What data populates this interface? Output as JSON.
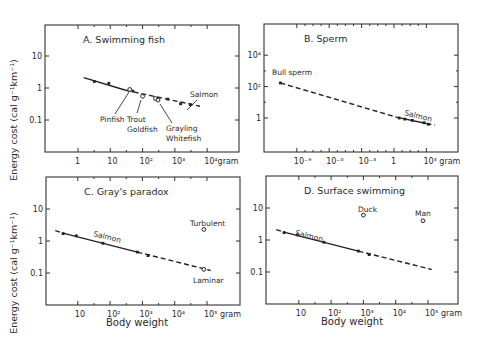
{
  "figure": {
    "y_axis_label": "Energy cost (cal g⁻¹km⁻¹)",
    "x_axis_label": "Body weight"
  },
  "chart_data": [
    {
      "id": "A",
      "type": "scatter",
      "title": "A.  Swimming fish",
      "xlabel": "",
      "ylabel": "Energy cost (cal g⁻¹km⁻¹)",
      "xscale": "log",
      "yscale": "log",
      "xlim": [
        0.1,
        100000
      ],
      "ylim": [
        0.01,
        100
      ],
      "x_ticks": [
        {
          "v": 1,
          "label": "1"
        },
        {
          "v": 10,
          "label": "10"
        },
        {
          "v": 100,
          "label": "10²"
        },
        {
          "v": 1000,
          "label": "10³"
        },
        {
          "v": 10000,
          "label": "10⁴gram"
        }
      ],
      "y_ticks": [
        {
          "v": 10,
          "label": "10"
        },
        {
          "v": 1,
          "label": "1"
        },
        {
          "v": 0.1,
          "label": "0.1"
        }
      ],
      "frame": {
        "x0": 45,
        "y0": 25,
        "x1": 239,
        "y1": 152
      },
      "map": {
        "x_px_at_1": 78,
        "px_per_decade_x": 32.3,
        "y_px_at_1": 88,
        "px_per_decade_y": 32
      },
      "lines": [
        {
          "style": "solid",
          "points": [
            [
              1.5,
              2.1
            ],
            [
              30,
              0.85
            ]
          ]
        },
        {
          "style": "dashed",
          "points": [
            [
              30,
              0.85
            ],
            [
              6000,
              0.27
            ]
          ]
        }
      ],
      "series": [
        {
          "name": "Salmon",
          "marker": "filled",
          "x": [
            3.2,
            9,
            50,
            600,
            1500,
            3000
          ],
          "y": [
            1.6,
            1.4,
            0.8,
            0.45,
            0.32,
            0.3
          ]
        },
        {
          "name": "Pinfish",
          "marker": "open",
          "x": [
            40
          ],
          "y": [
            0.9
          ]
        },
        {
          "name": "Trout/Goldfish",
          "marker": "open",
          "x": [
            100
          ],
          "y": [
            0.55
          ]
        },
        {
          "name": "Grayling/Whitefish",
          "marker": "open",
          "x": [
            250,
            300
          ],
          "y": [
            0.47,
            0.42
          ]
        }
      ],
      "annotations": [
        {
          "text": "Salmon",
          "x": 190,
          "y": 97,
          "leader": [
            197,
            100,
            187,
            110
          ]
        },
        {
          "text": "Pinfish",
          "x": 100,
          "y": 122,
          "leader": [
            115,
            114,
            129,
            92
          ]
        },
        {
          "text": "Trout",
          "x": 127,
          "y": 122,
          "leader": [
            137,
            113,
            141,
            100
          ]
        },
        {
          "text": "Goldfish",
          "x": 127,
          "y": 132,
          "leader": null
        },
        {
          "text": "Grayling",
          "x": 166,
          "y": 131,
          "leader": [
            172,
            123,
            160,
            104
          ]
        },
        {
          "text": "Whitefish",
          "x": 166,
          "y": 141,
          "leader": null
        }
      ]
    },
    {
      "id": "B",
      "type": "scatter",
      "title": "B.  Sperm",
      "xlabel": "",
      "ylabel": "",
      "xscale": "log",
      "yscale": "log",
      "xlim": [
        1e-12,
        1000000.0
      ],
      "ylim": [
        0.01,
        1000000
      ],
      "x_ticks": [
        {
          "v": 1e-09,
          "label": "10⁻⁹"
        },
        {
          "v": 1e-06,
          "label": "10⁻⁶"
        },
        {
          "v": 0.001,
          "label": "10⁻³"
        },
        {
          "v": 1,
          "label": "1"
        },
        {
          "v": 1000,
          "label": "10³ gram"
        }
      ],
      "y_ticks": [
        {
          "v": 10000,
          "label": "10⁴"
        },
        {
          "v": 100,
          "label": "10²"
        },
        {
          "v": 1,
          "label": "1"
        }
      ],
      "frame": {
        "x0": 264,
        "y0": 24,
        "x1": 458,
        "y1": 152
      },
      "map": {
        "x_px_at_1": 394,
        "px_per_decade_x": 10.8,
        "y_px_at_1": 118,
        "px_per_decade_y": 15.7
      },
      "lines": [
        {
          "style": "dashed",
          "points": [
            [
              3e-11,
              170
            ],
            [
              2,
              1.1
            ]
          ]
        },
        {
          "style": "solid",
          "points": [
            [
              2,
              1.1
            ],
            [
              1000,
              0.45
            ]
          ]
        },
        {
          "style": "dashed",
          "points": [
            [
              1000,
              0.45
            ],
            [
              6000,
              0.35
            ]
          ]
        }
      ],
      "series": [
        {
          "name": "Bull sperm",
          "marker": "filled",
          "x": [
            3e-11
          ],
          "y": [
            170
          ]
        },
        {
          "name": "Salmon",
          "marker": "filled",
          "x": [
            3,
            10,
            50,
            600,
            1500
          ],
          "y": [
            1.0,
            0.85,
            0.7,
            0.5,
            0.4
          ]
        }
      ],
      "annotations": [
        {
          "text": "Bull sperm",
          "x": 272,
          "y": 75,
          "leader": null
        },
        {
          "text": "Salmon",
          "x": 404,
          "y": 115,
          "rotate": 14,
          "leader": null
        }
      ]
    },
    {
      "id": "C",
      "type": "scatter",
      "title": "C.  Gray's paradox",
      "xlabel": "Body weight",
      "ylabel": "Energy cost (cal g⁻¹km⁻¹)",
      "xscale": "log",
      "yscale": "log",
      "xlim": [
        1,
        1000000
      ],
      "ylim": [
        0.01,
        100
      ],
      "x_ticks": [
        {
          "v": 10,
          "label": "10"
        },
        {
          "v": 100,
          "label": "10²"
        },
        {
          "v": 1000,
          "label": "10³"
        },
        {
          "v": 10000,
          "label": "10⁴"
        },
        {
          "v": 100000,
          "label": "10⁵ gram"
        }
      ],
      "y_ticks": [
        {
          "v": 10,
          "label": "10"
        },
        {
          "v": 1,
          "label": "1"
        },
        {
          "v": 0.1,
          "label": "0.1"
        }
      ],
      "frame": {
        "x0": 46,
        "y0": 177,
        "x1": 240,
        "y1": 305
      },
      "map": {
        "x_px_at_1": 45.5,
        "px_per_decade_x": 32.3,
        "y_px_at_1": 241,
        "px_per_decade_y": 32
      },
      "lines": [
        {
          "style": "dashed",
          "points": [
            [
              2,
              2.1
            ],
            [
              4,
              1.7
            ]
          ]
        },
        {
          "style": "solid",
          "points": [
            [
              4,
              1.7
            ],
            [
              700,
              0.45
            ]
          ]
        },
        {
          "style": "dashed",
          "points": [
            [
              700,
              0.45
            ],
            [
              130000,
              0.12
            ]
          ]
        }
      ],
      "series": [
        {
          "name": "Salmon",
          "marker": "filled",
          "x": [
            3.5,
            9,
            60,
            700,
            1500
          ],
          "y": [
            1.7,
            1.45,
            0.85,
            0.45,
            0.35
          ]
        },
        {
          "name": "Turbulent",
          "marker": "open",
          "x": [
            80000
          ],
          "y": [
            2.3
          ]
        },
        {
          "name": "Laminar",
          "marker": "open",
          "x": [
            80000
          ],
          "y": [
            0.13
          ]
        }
      ],
      "annotations": [
        {
          "text": "Salmon",
          "x": 93,
          "y": 236,
          "rotate": 14,
          "leader": null
        },
        {
          "text": "Turbulent",
          "x": 190,
          "y": 226,
          "leader": null
        },
        {
          "text": "Laminar",
          "x": 193,
          "y": 283,
          "leader": null
        }
      ]
    },
    {
      "id": "D",
      "type": "scatter",
      "title": "D.  Surface swimming",
      "xlabel": "Body weight",
      "ylabel": "",
      "xscale": "log",
      "yscale": "log",
      "xlim": [
        1,
        1000000
      ],
      "ylim": [
        0.01,
        100
      ],
      "x_ticks": [
        {
          "v": 10,
          "label": "10"
        },
        {
          "v": 100,
          "label": "10²"
        },
        {
          "v": 1000,
          "label": "10³"
        },
        {
          "v": 10000,
          "label": "10⁴"
        },
        {
          "v": 100000,
          "label": "10⁵ gram"
        }
      ],
      "y_ticks": [
        {
          "v": 10,
          "label": "10"
        },
        {
          "v": 1,
          "label": "1"
        },
        {
          "v": 0.1,
          "label": "0.1"
        }
      ],
      "frame": {
        "x0": 266,
        "y0": 176,
        "x1": 458,
        "y1": 304
      },
      "map": {
        "x_px_at_1": 266.5,
        "px_per_decade_x": 32.3,
        "y_px_at_1": 240,
        "px_per_decade_y": 32
      },
      "lines": [
        {
          "style": "dashed",
          "points": [
            [
              2,
              2.1
            ],
            [
              4,
              1.7
            ]
          ]
        },
        {
          "style": "solid",
          "points": [
            [
              4,
              1.7
            ],
            [
              700,
              0.45
            ]
          ]
        },
        {
          "style": "dashed",
          "points": [
            [
              700,
              0.45
            ],
            [
              130000,
              0.12
            ]
          ]
        }
      ],
      "series": [
        {
          "name": "Salmon",
          "marker": "filled",
          "x": [
            3.5,
            9,
            60,
            700,
            1500
          ],
          "y": [
            1.7,
            1.45,
            0.85,
            0.45,
            0.35
          ]
        },
        {
          "name": "Duck",
          "marker": "open",
          "x": [
            1000
          ],
          "y": [
            6
          ]
        },
        {
          "name": "Man",
          "marker": "open",
          "x": [
            70000
          ],
          "y": [
            4
          ]
        }
      ],
      "annotations": [
        {
          "text": "Salmon",
          "x": 295,
          "y": 235,
          "rotate": 14,
          "leader": null
        },
        {
          "text": "Duck",
          "x": 358,
          "y": 212,
          "leader": null
        },
        {
          "text": "Man",
          "x": 415,
          "y": 216,
          "leader": null
        }
      ]
    }
  ]
}
